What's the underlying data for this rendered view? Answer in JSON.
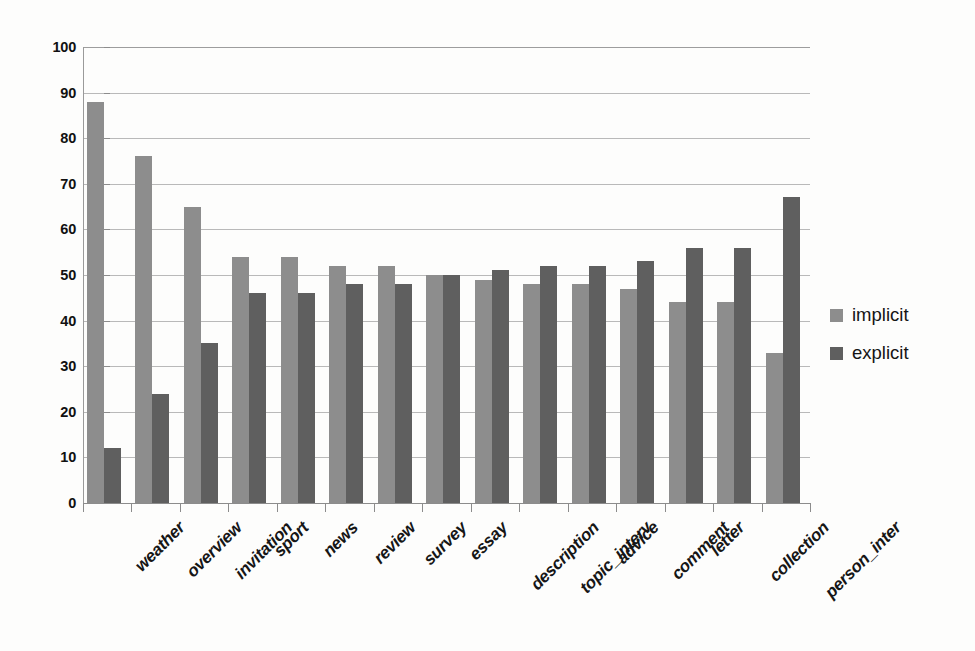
{
  "chart_data": {
    "type": "bar",
    "title": "",
    "subtitle": "",
    "xlabel": "",
    "ylabel": "",
    "ylim": [
      0,
      100
    ],
    "ytick_step": 10,
    "yticks": [
      0,
      10,
      20,
      30,
      40,
      50,
      60,
      70,
      80,
      90,
      100
    ],
    "grid": "horizontal",
    "legend_position": "right",
    "categories": [
      "weather",
      "overview",
      "invitation",
      "sport",
      "news",
      "review",
      "survey",
      "essay",
      "description",
      "topic_interv",
      "advice",
      "comment",
      "letter",
      "collection",
      "person_inter"
    ],
    "series": [
      {
        "name": "implicit",
        "color": "#8d8d8d",
        "values": [
          88,
          76,
          65,
          54,
          54,
          52,
          52,
          50,
          49,
          48,
          48,
          47,
          44,
          44,
          33
        ]
      },
      {
        "name": "explicit",
        "color": "#5f5f5f",
        "values": [
          12,
          24,
          35,
          46,
          46,
          48,
          48,
          50,
          51,
          52,
          52,
          53,
          56,
          56,
          67
        ]
      }
    ]
  },
  "legend": {
    "items": [
      {
        "label": "implicit",
        "color": "#8d8d8d"
      },
      {
        "label": "explicit",
        "color": "#5f5f5f"
      }
    ]
  },
  "colors": {
    "background": "#fdfdfc",
    "gridline": "#b9b9b9",
    "axis": "#8c8c8c",
    "implicit": "#8d8d8d",
    "explicit": "#5f5f5f",
    "text": "#151515"
  }
}
